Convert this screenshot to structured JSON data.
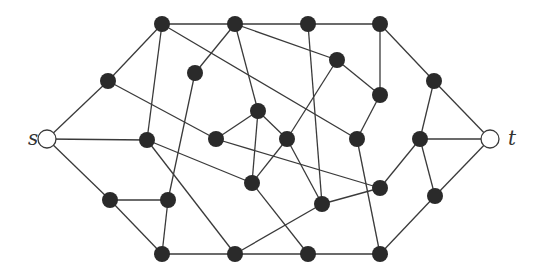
{
  "diagram": {
    "type": "s-t graph",
    "labels": {
      "source": "s",
      "sink": "t"
    },
    "colors": {
      "edge": "#3a3a3a",
      "node_fill": "#2a2a2a",
      "terminal_fill": "#ffffff"
    },
    "node_radius": 8,
    "terminal_radius": 9,
    "nodes": [
      {
        "id": "s",
        "x": 47,
        "y": 139,
        "kind": "terminal"
      },
      {
        "id": "t",
        "x": 490,
        "y": 139,
        "kind": "terminal"
      },
      {
        "id": "a1",
        "x": 162,
        "y": 24
      },
      {
        "id": "a2",
        "x": 235,
        "y": 24
      },
      {
        "id": "a3",
        "x": 308,
        "y": 24
      },
      {
        "id": "a4",
        "x": 380,
        "y": 24
      },
      {
        "id": "b1",
        "x": 108,
        "y": 81
      },
      {
        "id": "b2",
        "x": 195,
        "y": 73
      },
      {
        "id": "b3",
        "x": 337,
        "y": 60
      },
      {
        "id": "b4",
        "x": 434,
        "y": 81
      },
      {
        "id": "c1",
        "x": 380,
        "y": 95
      },
      {
        "id": "c2",
        "x": 258,
        "y": 111
      },
      {
        "id": "d1",
        "x": 147,
        "y": 140
      },
      {
        "id": "d2",
        "x": 216,
        "y": 139
      },
      {
        "id": "d3",
        "x": 287,
        "y": 139
      },
      {
        "id": "d4",
        "x": 357,
        "y": 139
      },
      {
        "id": "d5",
        "x": 420,
        "y": 139
      },
      {
        "id": "e1",
        "x": 252,
        "y": 183
      },
      {
        "id": "e2",
        "x": 380,
        "y": 188
      },
      {
        "id": "e3",
        "x": 322,
        "y": 204
      },
      {
        "id": "e4",
        "x": 435,
        "y": 196
      },
      {
        "id": "f1",
        "x": 110,
        "y": 200
      },
      {
        "id": "f2",
        "x": 168,
        "y": 200
      },
      {
        "id": "g1",
        "x": 162,
        "y": 254
      },
      {
        "id": "g2",
        "x": 235,
        "y": 254
      },
      {
        "id": "g3",
        "x": 308,
        "y": 254
      },
      {
        "id": "g4",
        "x": 380,
        "y": 254
      }
    ],
    "edges": [
      [
        "s",
        "b1"
      ],
      [
        "s",
        "d1"
      ],
      [
        "s",
        "f1"
      ],
      [
        "b1",
        "a1"
      ],
      [
        "b1",
        "d2"
      ],
      [
        "a1",
        "a2"
      ],
      [
        "a1",
        "d1"
      ],
      [
        "a1",
        "d4"
      ],
      [
        "a2",
        "a3"
      ],
      [
        "a2",
        "b2"
      ],
      [
        "a2",
        "b3"
      ],
      [
        "a2",
        "c2"
      ],
      [
        "a3",
        "a4"
      ],
      [
        "a3",
        "e3"
      ],
      [
        "a4",
        "c1"
      ],
      [
        "a4",
        "b4"
      ],
      [
        "b3",
        "c1"
      ],
      [
        "b3",
        "d3"
      ],
      [
        "c1",
        "d4"
      ],
      [
        "b2",
        "f2"
      ],
      [
        "c2",
        "d2"
      ],
      [
        "c2",
        "d3"
      ],
      [
        "c2",
        "e1"
      ],
      [
        "d1",
        "e1"
      ],
      [
        "d1",
        "g2"
      ],
      [
        "d2",
        "e2"
      ],
      [
        "d3",
        "e1"
      ],
      [
        "d3",
        "e3"
      ],
      [
        "d4",
        "g4"
      ],
      [
        "e1",
        "g3"
      ],
      [
        "e3",
        "e2"
      ],
      [
        "e3",
        "g2"
      ],
      [
        "e2",
        "d5"
      ],
      [
        "f1",
        "f2"
      ],
      [
        "f1",
        "g1"
      ],
      [
        "f2",
        "g1"
      ],
      [
        "g1",
        "g2"
      ],
      [
        "g2",
        "g3"
      ],
      [
        "g3",
        "g4"
      ],
      [
        "g4",
        "e4"
      ],
      [
        "b4",
        "t"
      ],
      [
        "b4",
        "d5"
      ],
      [
        "d5",
        "t"
      ],
      [
        "d5",
        "e4"
      ],
      [
        "e4",
        "t"
      ]
    ]
  }
}
